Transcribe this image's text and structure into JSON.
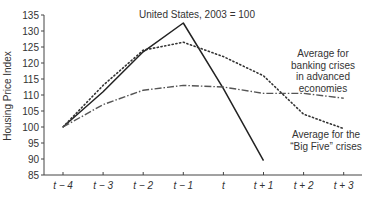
{
  "chart_data": {
    "type": "line",
    "title": "United States, 2003 = 100",
    "xlabel": "",
    "ylabel": "Housing Price Index",
    "categories": [
      "t − 4",
      "t − 3",
      "t − 2",
      "t − 1",
      "t",
      "t + 1",
      "t + 2",
      "t + 3"
    ],
    "ylim": [
      85,
      135
    ],
    "yticks": [
      85,
      90,
      95,
      100,
      105,
      110,
      115,
      120,
      125,
      130,
      135
    ],
    "grid": false,
    "series": [
      {
        "name": "United States, 2003 = 100",
        "style": "solid",
        "values": [
          100,
          111,
          123.5,
          132.5,
          112,
          89.5,
          null,
          null
        ]
      },
      {
        "name": "Average for the “Big Five” crises",
        "style": "dotted",
        "values": [
          100,
          113,
          124,
          126.5,
          122,
          116,
          104,
          99.5
        ]
      },
      {
        "name": "Average for banking crises in advanced economies",
        "style": "dash-dot",
        "values": [
          100,
          107,
          111.5,
          113,
          112.5,
          110.5,
          110.5,
          109
        ]
      }
    ],
    "annotations": [
      {
        "text": "United States, 2003 = 100",
        "target": "solid series"
      },
      {
        "lines": [
          "Average for",
          "banking crises",
          "in advanced",
          "economies"
        ],
        "target": "dash-dot series"
      },
      {
        "lines": [
          "Average for the",
          "“Big Five” crises"
        ],
        "target": "dotted series"
      }
    ]
  },
  "labels": {
    "ylabel": "Housing Price Index",
    "us_annotation": "United States, 2003 = 100",
    "adv_annotation": [
      "Average for",
      "banking crises",
      "in advanced",
      "economies"
    ],
    "big5_annotation": [
      "Average for the",
      "“Big Five” crises"
    ]
  }
}
